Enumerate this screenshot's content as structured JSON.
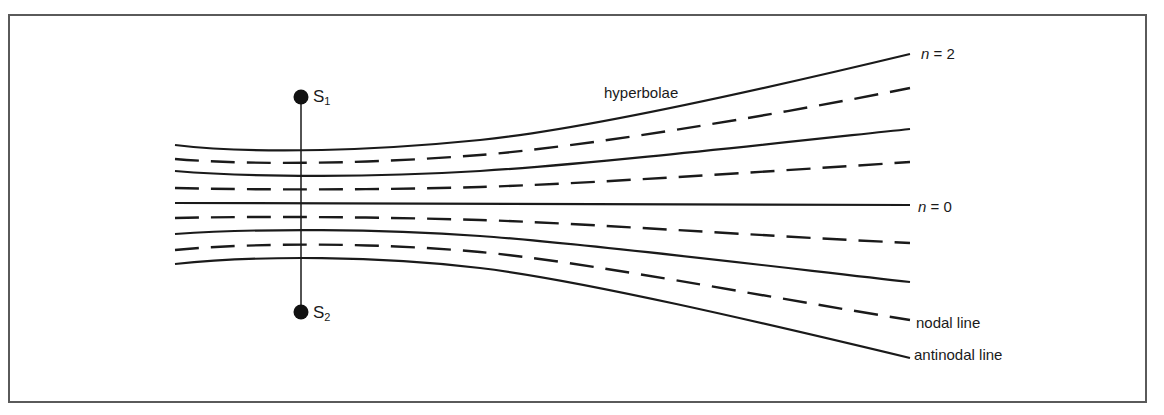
{
  "diagram": {
    "type": "two-source interference pattern",
    "colors": {
      "line": "#1a1a1a",
      "frame": "#5a5a5a",
      "background": "#ffffff"
    },
    "sources": [
      {
        "id": "S1",
        "label": "S",
        "subscript": "1",
        "x": 301,
        "y": 97
      },
      {
        "id": "S2",
        "label": "S",
        "subscript": "2",
        "x": 301,
        "y": 312
      }
    ],
    "labels": {
      "hyperbolae": "hyperbolae",
      "n2_var": "n",
      "n2_rest": " = 2",
      "n0_var": "n",
      "n0_rest": " = 0",
      "nodal": "nodal line",
      "antinodal": "antinodal line"
    },
    "lines": [
      {
        "kind": "antinodal",
        "order": "n=2",
        "d": "M175,145 C260,155 380,150 480,140 S760,90 910,54"
      },
      {
        "kind": "nodal",
        "d": "M175,159 C260,166 380,163 480,155 S760,118 910,88"
      },
      {
        "kind": "antinodal",
        "order": "n=1",
        "d": "M175,171 C260,178 380,177 480,171 S760,145 910,129"
      },
      {
        "kind": "nodal",
        "d": "M175,188 C260,190 380,190 480,187 S760,172 910,162"
      },
      {
        "kind": "antinodal",
        "order": "n=0",
        "d": "M175,203 L910,205"
      },
      {
        "kind": "nodal",
        "d": "M175,218 C260,216 380,217 480,220 S760,236 910,243"
      },
      {
        "kind": "antinodal",
        "order": "n=1",
        "d": "M175,234 C260,228 380,229 480,236 S760,265 910,282"
      },
      {
        "kind": "nodal",
        "d": "M175,250 C260,242 380,243 480,252 S760,296 910,320"
      },
      {
        "kind": "antinodal",
        "order": "n=2",
        "d": "M175,264 C260,255 380,256 480,268 S760,322 910,358"
      }
    ]
  }
}
